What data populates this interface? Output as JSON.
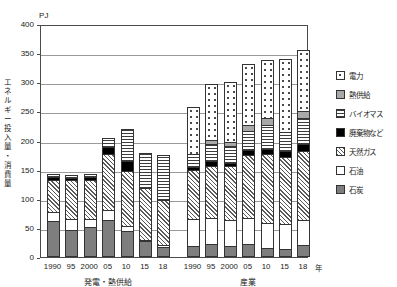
{
  "chart_data": {
    "type": "bar",
    "stacked": true,
    "title": "",
    "ylabel": "エネルギー投入量・消費量",
    "yunit": "PJ",
    "xlabel": "年",
    "ylim": [
      0,
      400
    ],
    "ytick_step": 50,
    "yticks": [
      "0",
      "50",
      "100",
      "150",
      "200",
      "250",
      "300",
      "350",
      "400"
    ],
    "grid": true,
    "legend_position": "right",
    "series": [
      {
        "name": "電力",
        "key": "elec",
        "pattern": "dotted"
      },
      {
        "name": "熱供給",
        "key": "heat",
        "pattern": "solid-gray"
      },
      {
        "name": "バイオマス",
        "key": "bio",
        "pattern": "horizontal-lines"
      },
      {
        "name": "廃棄物など",
        "key": "waste",
        "pattern": "solid-black"
      },
      {
        "name": "天然ガス",
        "key": "gas",
        "pattern": "diagonal-hatch"
      },
      {
        "name": "石油",
        "key": "oil",
        "pattern": "white"
      },
      {
        "name": "石炭",
        "key": "coal",
        "pattern": "solid-darkgray"
      }
    ],
    "groups": [
      {
        "name": "発電・熱供給",
        "categories": [
          "1990",
          "95",
          "2000",
          "05",
          "10",
          "15",
          "18"
        ],
        "values": {
          "coal": [
            62,
            47,
            51,
            63,
            44,
            27,
            18
          ],
          "oil": [
            16,
            18,
            15,
            17,
            10,
            2,
            2
          ],
          "gas": [
            55,
            67,
            66,
            97,
            94,
            90,
            77
          ],
          "waste": [
            5,
            4,
            5,
            11,
            17,
            0,
            0
          ],
          "bio": [
            5,
            4,
            5,
            17,
            55,
            60,
            78
          ],
          "heat": [
            0,
            0,
            0,
            0,
            0,
            0,
            0
          ],
          "elec": [
            0,
            0,
            0,
            0,
            0,
            0,
            0
          ]
        },
        "totals": [
          143,
          140,
          142,
          205,
          220,
          179,
          175
        ]
      },
      {
        "name": "産業",
        "categories": [
          "1990",
          "95",
          "2000",
          "05",
          "10",
          "15",
          "18"
        ],
        "values": {
          "coal": [
            19,
            22,
            19,
            22,
            16,
            13,
            21
          ],
          "oil": [
            47,
            45,
            45,
            45,
            43,
            43,
            43
          ],
          "gas": [
            83,
            90,
            92,
            108,
            118,
            115,
            118
          ],
          "waste": [
            6,
            7,
            6,
            8,
            9,
            11,
            12
          ],
          "bio": [
            21,
            30,
            29,
            33,
            41,
            32,
            44
          ],
          "heat": [
            0,
            7,
            7,
            10,
            12,
            0,
            13
          ],
          "elec": [
            81,
            96,
            102,
            106,
            100,
            126,
            104
          ]
        },
        "totals": [
          257,
          297,
          300,
          332,
          339,
          340,
          355
        ]
      }
    ]
  },
  "axis": {
    "unit": "PJ",
    "y_title_chars": [
      "エ",
      "ネ",
      "ル",
      "ギ",
      "ー",
      "投",
      "入",
      "量",
      "・",
      "消",
      "費",
      "量"
    ],
    "year_suffix": "年"
  }
}
